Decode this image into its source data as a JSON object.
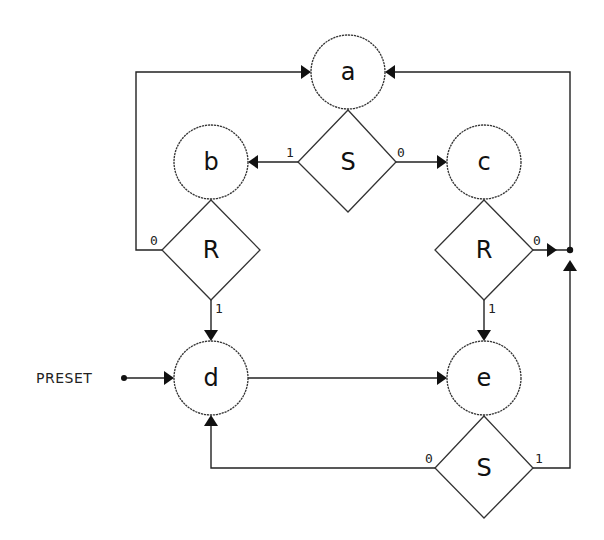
{
  "diagram": {
    "type": "state-machine-flowchart",
    "colors": {
      "line": "#222222",
      "background": "#ffffff"
    },
    "states": [
      {
        "id": "a",
        "label": "a"
      },
      {
        "id": "b",
        "label": "b"
      },
      {
        "id": "c",
        "label": "c"
      },
      {
        "id": "d",
        "label": "d"
      },
      {
        "id": "e",
        "label": "e"
      }
    ],
    "decisions": [
      {
        "id": "s_top",
        "label": "S",
        "from_state": "a",
        "branch_1": "b",
        "branch_0": "c"
      },
      {
        "id": "r_left",
        "label": "R",
        "from_state": "b",
        "branch_0": "a",
        "branch_1": "d"
      },
      {
        "id": "r_right",
        "label": "R",
        "from_state": "c",
        "branch_0": "a",
        "branch_1": "e"
      },
      {
        "id": "s_bottom",
        "label": "S",
        "from_state": "e",
        "branch_0": "d",
        "branch_1": "a"
      }
    ],
    "branch_labels": {
      "s_top_1": "1",
      "s_top_0": "0",
      "r_left_0": "0",
      "r_left_1": "1",
      "r_right_0": "0",
      "r_right_1": "1",
      "s_bottom_0": "0",
      "s_bottom_1": "1"
    },
    "inputs": [
      {
        "id": "preset",
        "label": "PRESET",
        "target": "d"
      }
    ],
    "transitions": [
      {
        "from": "d",
        "to": "e",
        "condition": "unconditional"
      }
    ]
  }
}
